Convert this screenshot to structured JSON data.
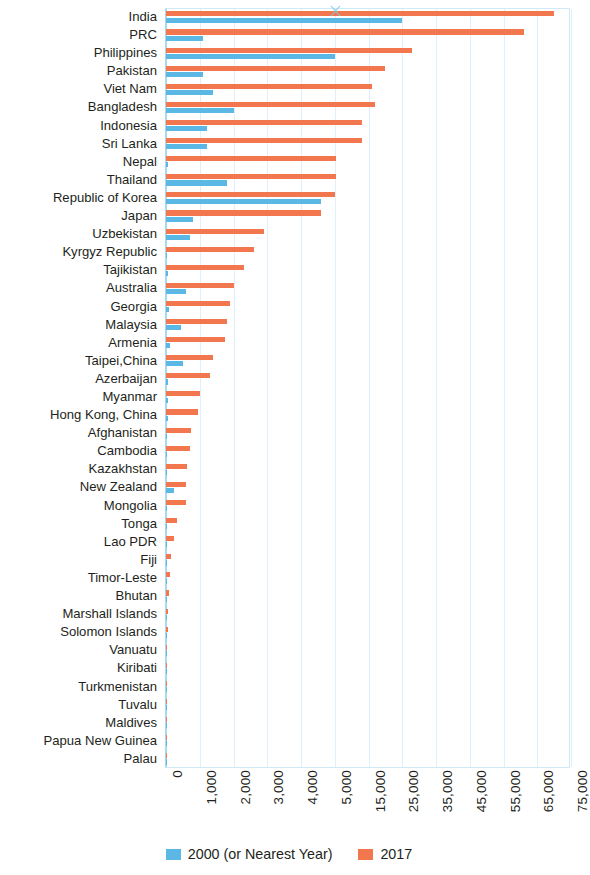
{
  "chart_data": {
    "type": "bar",
    "orientation": "horizontal",
    "title": "",
    "subtitle": "",
    "xlabel": "",
    "ylabel": "",
    "grid": true,
    "legend_position": "bottom-center",
    "axis_note": "broken x-axis between 5,000 and 15,000",
    "xticks": [
      "0",
      "1,000",
      "2,000",
      "3,000",
      "4,000",
      "5,000",
      "15,000",
      "25,000",
      "35,000",
      "45,000",
      "55,000",
      "65,000",
      "75,000"
    ],
    "xtick_values": [
      0,
      1000,
      2000,
      3000,
      4000,
      5000,
      15000,
      25000,
      35000,
      45000,
      55000,
      65000,
      75000
    ],
    "xlim": [
      0,
      75000
    ],
    "colors": {
      "series_2000": "#5BB8E5",
      "series_2017": "#F2764E",
      "grid": "#DFF0FA",
      "axis": "#A9D9EF"
    },
    "categories": [
      "India",
      "PRC",
      "Philippines",
      "Pakistan",
      "Viet Nam",
      "Bangladesh",
      "Indonesia",
      "Sri Lanka",
      "Nepal",
      "Thailand",
      "Republic of Korea",
      "Japan",
      "Uzbekistan",
      "Kyrgyz Republic",
      "Tajikistan",
      "Australia",
      "Georgia",
      "Malaysia",
      "Armenia",
      "Taipei,China",
      "Azerbaijan",
      "Myanmar",
      "Hong Kong, China",
      "Afghanistan",
      "Cambodia",
      "Kazakhstan",
      "New Zealand",
      "Mongolia",
      "Tonga",
      "Lao PDR",
      "Fiji",
      "Timor-Leste",
      "Bhutan",
      "Marshall Islands",
      "Solomon Islands",
      "Vanuatu",
      "Kiribati",
      "Turkmenistan",
      "Tuvalu",
      "Maldives",
      "Papua New Guinea",
      "Palau"
    ],
    "series": [
      {
        "name": "2000 (or Nearest Year)",
        "color": "#5BB8E5",
        "values": [
          25000,
          1100,
          5000,
          1100,
          1400,
          2000,
          1200,
          1200,
          60,
          1800,
          4600,
          800,
          700,
          40,
          50,
          600,
          100,
          450,
          120,
          500,
          60,
          70,
          60,
          30,
          30,
          40,
          250,
          40,
          30,
          20,
          25,
          15,
          10,
          5,
          5,
          5,
          5,
          5,
          3,
          3,
          3,
          2
        ]
      },
      {
        "name": "2017",
        "color": "#F2764E",
        "values": [
          70000,
          61000,
          28000,
          20000,
          16000,
          17000,
          13000,
          13000,
          5300,
          5400,
          5200,
          4600,
          2900,
          2600,
          2300,
          2000,
          1900,
          1800,
          1750,
          1400,
          1300,
          1000,
          950,
          750,
          700,
          620,
          600,
          580,
          330,
          240,
          160,
          120,
          90,
          50,
          45,
          40,
          35,
          30,
          25,
          20,
          20,
          15
        ]
      }
    ]
  },
  "legend": {
    "items": [
      {
        "label": "2000 (or Nearest Year)",
        "color": "#5BB8E5"
      },
      {
        "label": "2017",
        "color": "#F2764E"
      }
    ]
  }
}
